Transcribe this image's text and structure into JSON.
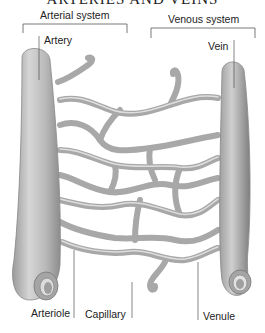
{
  "title": "ARTERIES AND VEINS",
  "labels": {
    "arterial_system": "Arterial system",
    "venous_system": "Venous system",
    "artery": "Artery",
    "vein": "Vein",
    "arteriole": "Arteriole",
    "capillary": "Capillary",
    "venule": "Venule"
  },
  "colors": {
    "vessel_fill": "#bdbdbd",
    "vessel_dark": "#8a8a8a",
    "vessel_light": "#e0e0e0",
    "line": "#555555"
  }
}
